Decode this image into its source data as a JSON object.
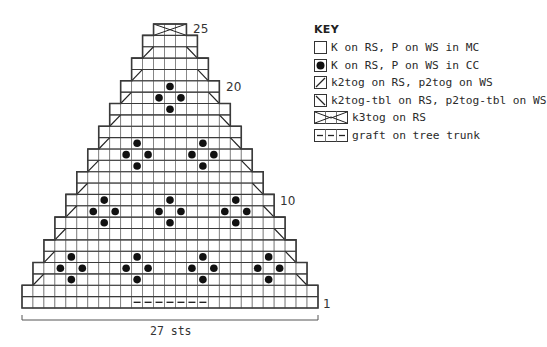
{
  "chart_data": {
    "type": "knitting-chart",
    "title": "",
    "stitch_count_label": "27 sts",
    "total_rows": 25,
    "total_stitches": 27,
    "row_labels": [
      {
        "row": 1,
        "label": "1"
      },
      {
        "row": 10,
        "label": "10"
      },
      {
        "row": 20,
        "label": "20"
      },
      {
        "row": 25,
        "label": "25"
      }
    ],
    "rows": [
      {
        "row": 1,
        "start": 0,
        "end": 26
      },
      {
        "row": 2,
        "start": 0,
        "end": 26
      },
      {
        "row": 3,
        "start": 1,
        "end": 25,
        "decrease": true
      },
      {
        "row": 4,
        "start": 1,
        "end": 25
      },
      {
        "row": 5,
        "start": 2,
        "end": 24,
        "decrease": true
      },
      {
        "row": 6,
        "start": 2,
        "end": 24
      },
      {
        "row": 7,
        "start": 3,
        "end": 23,
        "decrease": true
      },
      {
        "row": 8,
        "start": 3,
        "end": 23
      },
      {
        "row": 9,
        "start": 4,
        "end": 22,
        "decrease": true
      },
      {
        "row": 10,
        "start": 4,
        "end": 22
      },
      {
        "row": 11,
        "start": 5,
        "end": 21,
        "decrease": true
      },
      {
        "row": 12,
        "start": 5,
        "end": 21
      },
      {
        "row": 13,
        "start": 6,
        "end": 20,
        "decrease": true
      },
      {
        "row": 14,
        "start": 6,
        "end": 20
      },
      {
        "row": 15,
        "start": 7,
        "end": 19,
        "decrease": true
      },
      {
        "row": 16,
        "start": 7,
        "end": 19
      },
      {
        "row": 17,
        "start": 8,
        "end": 18,
        "decrease": true
      },
      {
        "row": 18,
        "start": 8,
        "end": 18
      },
      {
        "row": 19,
        "start": 9,
        "end": 17,
        "decrease": true
      },
      {
        "row": 20,
        "start": 9,
        "end": 17
      },
      {
        "row": 21,
        "start": 10,
        "end": 16,
        "decrease": true
      },
      {
        "row": 22,
        "start": 10,
        "end": 16
      },
      {
        "row": 23,
        "start": 11,
        "end": 15,
        "decrease": true
      },
      {
        "row": 24,
        "start": 11,
        "end": 15
      },
      {
        "row": 25,
        "start": 12,
        "end": 14,
        "k3tog": true
      }
    ],
    "cc_dots": [
      {
        "row": 5,
        "col": 4
      },
      {
        "row": 4,
        "col": 3
      },
      {
        "row": 4,
        "col": 5
      },
      {
        "row": 3,
        "col": 4
      },
      {
        "row": 5,
        "col": 10
      },
      {
        "row": 4,
        "col": 9
      },
      {
        "row": 4,
        "col": 11
      },
      {
        "row": 3,
        "col": 10
      },
      {
        "row": 5,
        "col": 16
      },
      {
        "row": 4,
        "col": 15
      },
      {
        "row": 4,
        "col": 17
      },
      {
        "row": 3,
        "col": 16
      },
      {
        "row": 5,
        "col": 22
      },
      {
        "row": 4,
        "col": 21
      },
      {
        "row": 4,
        "col": 23
      },
      {
        "row": 3,
        "col": 22
      },
      {
        "row": 10,
        "col": 7
      },
      {
        "row": 9,
        "col": 6
      },
      {
        "row": 9,
        "col": 8
      },
      {
        "row": 8,
        "col": 7
      },
      {
        "row": 10,
        "col": 13
      },
      {
        "row": 9,
        "col": 12
      },
      {
        "row": 9,
        "col": 14
      },
      {
        "row": 8,
        "col": 13
      },
      {
        "row": 10,
        "col": 19
      },
      {
        "row": 9,
        "col": 18
      },
      {
        "row": 9,
        "col": 20
      },
      {
        "row": 8,
        "col": 19
      },
      {
        "row": 15,
        "col": 10
      },
      {
        "row": 14,
        "col": 9
      },
      {
        "row": 14,
        "col": 11
      },
      {
        "row": 13,
        "col": 10
      },
      {
        "row": 15,
        "col": 16
      },
      {
        "row": 14,
        "col": 15
      },
      {
        "row": 14,
        "col": 17
      },
      {
        "row": 13,
        "col": 16
      },
      {
        "row": 20,
        "col": 13
      },
      {
        "row": 19,
        "col": 12
      },
      {
        "row": 19,
        "col": 14
      },
      {
        "row": 18,
        "col": 13
      }
    ],
    "graft": {
      "row": 1,
      "start_col": 10,
      "end_col": 16
    }
  },
  "key": {
    "title": "KEY",
    "items": [
      {
        "symbol": "empty-square",
        "label": "K on RS, P on WS in MC"
      },
      {
        "symbol": "dot-square",
        "label": "K on RS, P on WS in CC"
      },
      {
        "symbol": "k2tog-square",
        "label": "k2tog on RS, p2tog on WS"
      },
      {
        "symbol": "k2tog-tbl-square",
        "label": "k2tog-tbl on RS, p2tog-tbl on WS"
      },
      {
        "symbol": "k3tog-box",
        "label": "k3tog on RS"
      },
      {
        "symbol": "graft-dashes",
        "label": "graft on tree trunk"
      }
    ]
  },
  "colors": {
    "grid": "#3a3a3a",
    "grid_thin": "#777777",
    "dot": "#111111"
  }
}
